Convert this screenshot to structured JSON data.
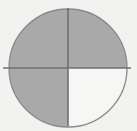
{
  "figure": {
    "name": "quadrant-shaded-circle",
    "canvas": {
      "width": 137,
      "height": 131,
      "background_color": "#f2f2f1"
    },
    "circle": {
      "center_x": 68,
      "center_y": 68,
      "radius": 59,
      "outline_color": "#8a8a8a",
      "outline_width": 1.3
    },
    "crosshair": {
      "line_color": "#707070",
      "line_width": 1.6,
      "vertical": {
        "x": 68,
        "y_start": 8,
        "y_end": 126
      },
      "horizontal": {
        "y": 68,
        "x_start": 3,
        "x_end": 131
      }
    },
    "quadrants": [
      {
        "id": "top-left",
        "label": "Top Left",
        "shaded": true,
        "fill_color": "#a9a9a9"
      },
      {
        "id": "top-right",
        "label": "Top Right",
        "shaded": true,
        "fill_color": "#a9a9a9"
      },
      {
        "id": "bottom-left",
        "label": "Bottom Left",
        "shaded": true,
        "fill_color": "#a9a9a9"
      },
      {
        "id": "bottom-right",
        "label": "Bottom Right",
        "shaded": false,
        "fill_color": "#f6f6f5"
      }
    ],
    "shaded_fraction_text": "3/4"
  }
}
